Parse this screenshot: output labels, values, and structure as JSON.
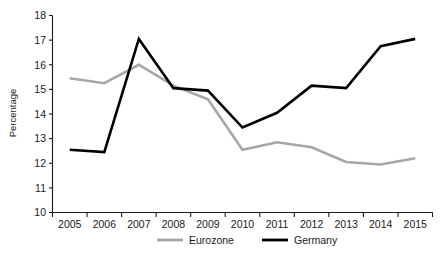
{
  "chart_data": {
    "type": "line",
    "title": "",
    "xlabel": "",
    "ylabel": "Percentage",
    "categories": [
      "2005",
      "2006",
      "2007",
      "2008",
      "2009",
      "2010",
      "2011",
      "2012",
      "2013",
      "2014",
      "2015"
    ],
    "x": [
      2005,
      2006,
      2007,
      2008,
      2009,
      2010,
      2011,
      2012,
      2013,
      2014,
      2015
    ],
    "ylim": [
      10,
      18
    ],
    "yticks": [
      10,
      11,
      12,
      13,
      14,
      15,
      16,
      17,
      18
    ],
    "ytick_labels": [
      "10",
      "11",
      "12",
      "13",
      "14",
      "15",
      "16",
      "17",
      "18"
    ],
    "grid": false,
    "legend_position": "bottom",
    "series": [
      {
        "name": "Eurozone",
        "color": "#a6a6a6",
        "values": [
          15.45,
          15.25,
          16.0,
          15.15,
          14.6,
          12.55,
          12.85,
          12.65,
          12.05,
          11.95,
          12.2
        ]
      },
      {
        "name": "Germany",
        "color": "#000000",
        "values": [
          12.55,
          12.45,
          17.05,
          15.05,
          14.95,
          13.45,
          14.05,
          15.15,
          15.05,
          16.75,
          17.05
        ]
      }
    ]
  },
  "legend": {
    "items": [
      {
        "label": "Eurozone",
        "color": "#a6a6a6"
      },
      {
        "label": "Germany",
        "color": "#000000"
      }
    ]
  },
  "axes": {
    "y_title": "Percentage"
  }
}
